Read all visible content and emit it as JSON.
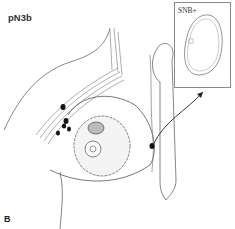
{
  "figure": {
    "stage_label": "pN3b",
    "panel_letter": "B",
    "inset": {
      "label": "SNB+"
    }
  },
  "colors": {
    "line": "#555555",
    "node": "#111111",
    "frame": "#8a8a8a"
  }
}
